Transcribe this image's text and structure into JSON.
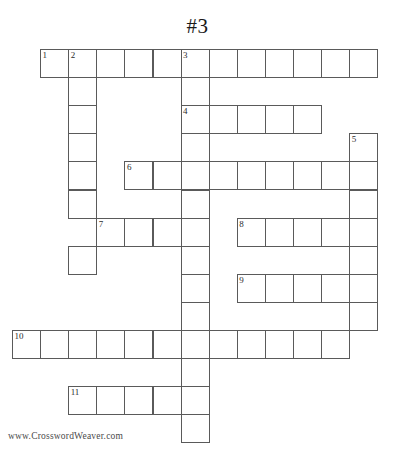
{
  "page": {
    "title": "#3",
    "footer_credit": "www.CrosswordWeaver.com",
    "background_color": "#ffffff",
    "cell_border_color": "#5a5a5a",
    "number_color": "#2b2b2b"
  },
  "grid": {
    "origin_x": 12,
    "origin_y": 49,
    "cell_size": 28.1,
    "columns": 13,
    "rows": 14
  },
  "entries": [
    {
      "number": "1",
      "direction": "across",
      "row": 0,
      "col": 1,
      "length": 12
    },
    {
      "number": "2",
      "direction": "down",
      "row": 0,
      "col": 2,
      "length": 8
    },
    {
      "number": "3",
      "direction": "down",
      "row": 0,
      "col": 6,
      "length": 14
    },
    {
      "number": "4",
      "direction": "across",
      "row": 2,
      "col": 6,
      "length": 5
    },
    {
      "number": "5",
      "direction": "down",
      "row": 3,
      "col": 12,
      "length": 8
    },
    {
      "number": "6",
      "direction": "across",
      "row": 4,
      "col": 4,
      "length": 9
    },
    {
      "number": "7",
      "direction": "across",
      "row": 6,
      "col": 3,
      "length": 4
    },
    {
      "number": "8",
      "direction": "across",
      "row": 6,
      "col": 8,
      "length": 5
    },
    {
      "number": "9",
      "direction": "across",
      "row": 8,
      "col": 8,
      "length": 5
    },
    {
      "number": "10",
      "direction": "across",
      "row": 10,
      "col": 0,
      "length": 12
    },
    {
      "number": "11",
      "direction": "across",
      "row": 12,
      "col": 2,
      "length": 5
    }
  ],
  "cells": [
    {
      "row": 0,
      "col": 1,
      "number": "1"
    },
    {
      "row": 0,
      "col": 2,
      "number": "2"
    },
    {
      "row": 0,
      "col": 3,
      "number": ""
    },
    {
      "row": 0,
      "col": 4,
      "number": ""
    },
    {
      "row": 0,
      "col": 5,
      "number": ""
    },
    {
      "row": 0,
      "col": 6,
      "number": "3"
    },
    {
      "row": 0,
      "col": 7,
      "number": ""
    },
    {
      "row": 0,
      "col": 8,
      "number": ""
    },
    {
      "row": 0,
      "col": 9,
      "number": ""
    },
    {
      "row": 0,
      "col": 10,
      "number": ""
    },
    {
      "row": 0,
      "col": 11,
      "number": ""
    },
    {
      "row": 0,
      "col": 12,
      "number": ""
    },
    {
      "row": 1,
      "col": 2,
      "number": ""
    },
    {
      "row": 1,
      "col": 6,
      "number": ""
    },
    {
      "row": 2,
      "col": 2,
      "number": ""
    },
    {
      "row": 2,
      "col": 6,
      "number": "4"
    },
    {
      "row": 2,
      "col": 7,
      "number": ""
    },
    {
      "row": 2,
      "col": 8,
      "number": ""
    },
    {
      "row": 2,
      "col": 9,
      "number": ""
    },
    {
      "row": 2,
      "col": 10,
      "number": ""
    },
    {
      "row": 3,
      "col": 2,
      "number": ""
    },
    {
      "row": 3,
      "col": 6,
      "number": ""
    },
    {
      "row": 3,
      "col": 12,
      "number": "5"
    },
    {
      "row": 4,
      "col": 2,
      "number": ""
    },
    {
      "row": 4,
      "col": 4,
      "number": "6"
    },
    {
      "row": 4,
      "col": 5,
      "number": ""
    },
    {
      "row": 4,
      "col": 6,
      "number": ""
    },
    {
      "row": 4,
      "col": 7,
      "number": ""
    },
    {
      "row": 4,
      "col": 8,
      "number": ""
    },
    {
      "row": 4,
      "col": 9,
      "number": ""
    },
    {
      "row": 4,
      "col": 10,
      "number": ""
    },
    {
      "row": 4,
      "col": 11,
      "number": ""
    },
    {
      "row": 4,
      "col": 12,
      "number": ""
    },
    {
      "row": 5,
      "col": 2,
      "number": ""
    },
    {
      "row": 5,
      "col": 6,
      "number": ""
    },
    {
      "row": 5,
      "col": 12,
      "number": ""
    },
    {
      "row": 6,
      "col": 3,
      "number": "7"
    },
    {
      "row": 6,
      "col": 4,
      "number": ""
    },
    {
      "row": 6,
      "col": 5,
      "number": ""
    },
    {
      "row": 6,
      "col": 6,
      "number": ""
    },
    {
      "row": 6,
      "col": 8,
      "number": "8"
    },
    {
      "row": 6,
      "col": 9,
      "number": ""
    },
    {
      "row": 6,
      "col": 10,
      "number": ""
    },
    {
      "row": 6,
      "col": 11,
      "number": ""
    },
    {
      "row": 6,
      "col": 12,
      "number": ""
    },
    {
      "row": 7,
      "col": 2,
      "number": ""
    },
    {
      "row": 7,
      "col": 6,
      "number": ""
    },
    {
      "row": 7,
      "col": 12,
      "number": ""
    },
    {
      "row": 8,
      "col": 6,
      "number": ""
    },
    {
      "row": 8,
      "col": 8,
      "number": "9"
    },
    {
      "row": 8,
      "col": 9,
      "number": ""
    },
    {
      "row": 8,
      "col": 10,
      "number": ""
    },
    {
      "row": 8,
      "col": 11,
      "number": ""
    },
    {
      "row": 8,
      "col": 12,
      "number": ""
    },
    {
      "row": 9,
      "col": 6,
      "number": ""
    },
    {
      "row": 9,
      "col": 12,
      "number": ""
    },
    {
      "row": 10,
      "col": 0,
      "number": "10"
    },
    {
      "row": 10,
      "col": 1,
      "number": ""
    },
    {
      "row": 10,
      "col": 2,
      "number": ""
    },
    {
      "row": 10,
      "col": 3,
      "number": ""
    },
    {
      "row": 10,
      "col": 4,
      "number": ""
    },
    {
      "row": 10,
      "col": 5,
      "number": ""
    },
    {
      "row": 10,
      "col": 6,
      "number": ""
    },
    {
      "row": 10,
      "col": 7,
      "number": ""
    },
    {
      "row": 10,
      "col": 8,
      "number": ""
    },
    {
      "row": 10,
      "col": 9,
      "number": ""
    },
    {
      "row": 10,
      "col": 10,
      "number": ""
    },
    {
      "row": 10,
      "col": 11,
      "number": ""
    },
    {
      "row": 11,
      "col": 6,
      "number": ""
    },
    {
      "row": 12,
      "col": 2,
      "number": "11"
    },
    {
      "row": 12,
      "col": 3,
      "number": ""
    },
    {
      "row": 12,
      "col": 4,
      "number": ""
    },
    {
      "row": 12,
      "col": 5,
      "number": ""
    },
    {
      "row": 12,
      "col": 6,
      "number": ""
    },
    {
      "row": 13,
      "col": 6,
      "number": ""
    }
  ]
}
